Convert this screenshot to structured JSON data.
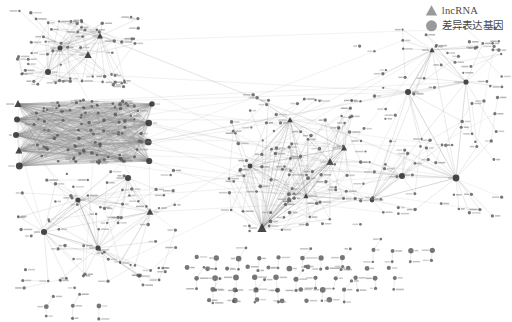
{
  "figure": {
    "background_color": "#ffffff",
    "width": 512,
    "height": 322
  },
  "legend": {
    "position": "top-right",
    "items": [
      {
        "label": "lncRNA",
        "marker": "triangle",
        "marker_icon": "triangle-marker-icon",
        "color": "#9a9a9a"
      },
      {
        "label": "差异表达基因",
        "marker": "circle",
        "marker_icon": "circle-marker-icon",
        "color": "#9a9a9a"
      }
    ]
  },
  "network_style": {
    "node_color": "#555555",
    "node_stroke": "#2e2e2e",
    "edge_color": "#8d8d8d",
    "label_color": "#8a8a8a",
    "hub_color": "#3a3a3a"
  },
  "chart_data": {
    "type": "network",
    "node_types": [
      "lncRNA",
      "差异表达基因"
    ],
    "node_count": 560,
    "edge_count": 1480,
    "clusters": [
      {
        "name": "dense-bipartite-cluster-left",
        "cx": 85,
        "cy": 132,
        "rx": 78,
        "ry": 36,
        "nodes": 120,
        "hubs": 8,
        "density": "very-high"
      },
      {
        "name": "upper-left-cluster",
        "cx": 78,
        "cy": 52,
        "rx": 66,
        "ry": 40,
        "nodes": 70,
        "hubs": 4,
        "density": "medium"
      },
      {
        "name": "lower-left-cluster",
        "cx": 95,
        "cy": 225,
        "rx": 78,
        "ry": 55,
        "nodes": 85,
        "hubs": 5,
        "density": "medium"
      },
      {
        "name": "central-radiating-cluster",
        "cx": 295,
        "cy": 160,
        "rx": 72,
        "ry": 65,
        "nodes": 110,
        "hubs": 6,
        "density": "high"
      },
      {
        "name": "right-sparse-network",
        "cx": 420,
        "cy": 120,
        "rx": 80,
        "ry": 72,
        "nodes": 95,
        "hubs": 6,
        "density": "low"
      },
      {
        "name": "isolated-components-bottom",
        "cx": 290,
        "cy": 275,
        "rx": 100,
        "ry": 35,
        "nodes": 80,
        "hubs": 0,
        "density": "isolated"
      }
    ],
    "layout": "force-directed",
    "grid": false,
    "axes": false
  }
}
